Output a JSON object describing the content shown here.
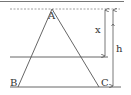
{
  "diagram": {
    "type": "geometry-triangle",
    "vertices": {
      "A": {
        "label": "A",
        "x": 52,
        "y": 9
      },
      "B": {
        "label": "B",
        "x": 18,
        "y": 87
      },
      "C": {
        "label": "C",
        "x": 99,
        "y": 87
      }
    },
    "dimensions": {
      "x": {
        "label": "x",
        "from_y": 9,
        "to_y": 57
      },
      "h": {
        "label": "h",
        "from_y": 9,
        "to_y": 87
      }
    },
    "lines": {
      "top_border": "solid",
      "apex_line": "dashed",
      "cut_line": "solid",
      "base_line": "solid"
    },
    "colors": {
      "stroke": "#555555",
      "text": "#333333",
      "background": "#ffffff"
    }
  }
}
